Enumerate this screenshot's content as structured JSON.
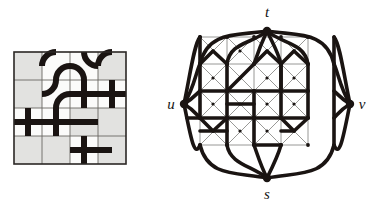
{
  "figure": {
    "caption": "",
    "panels": [
      "grid-tiling-panel",
      "graph-panel"
    ]
  },
  "colors": {
    "ink": "#1a1412",
    "ink_soft": "#241c18",
    "grid_line": "#5b5754",
    "cell_shaded": "#e2e2e0",
    "cell_empty": "#fbfbfa",
    "lattice_thin": "#8d8d8b",
    "border": "#2b2725",
    "background": "#ffffff"
  },
  "left_panel": {
    "name": "grid-tiling-panel",
    "rows": 4,
    "cols": 4,
    "origin": {
      "x": 14,
      "y": 52
    },
    "cell": 28,
    "cells": [
      {
        "r": 0,
        "c": 0,
        "fill": "shaded"
      },
      {
        "r": 0,
        "c": 1,
        "fill": "empty"
      },
      {
        "r": 0,
        "c": 2,
        "fill": "empty"
      },
      {
        "r": 0,
        "c": 3,
        "fill": "shaded"
      },
      {
        "r": 1,
        "c": 0,
        "fill": "shaded"
      },
      {
        "r": 1,
        "c": 1,
        "fill": "empty"
      },
      {
        "r": 1,
        "c": 2,
        "fill": "empty"
      },
      {
        "r": 1,
        "c": 3,
        "fill": "empty"
      },
      {
        "r": 2,
        "c": 0,
        "fill": "empty"
      },
      {
        "r": 2,
        "c": 1,
        "fill": "empty"
      },
      {
        "r": 2,
        "c": 2,
        "fill": "shaded"
      },
      {
        "r": 2,
        "c": 3,
        "fill": "shaded"
      },
      {
        "r": 3,
        "c": 0,
        "fill": "shaded"
      },
      {
        "r": 3,
        "c": 1,
        "fill": "shaded"
      },
      {
        "r": 3,
        "c": 2,
        "fill": "empty"
      },
      {
        "r": 3,
        "c": 3,
        "fill": "shaded"
      }
    ],
    "crosses": [
      {
        "r": 1,
        "c": 3,
        "name": "cross-r1c3"
      },
      {
        "r": 2,
        "c": 0,
        "name": "cross-r2c0"
      },
      {
        "r": 2,
        "c": 1,
        "name": "cross-r2c1"
      },
      {
        "r": 3,
        "c": 2,
        "name": "cross-r3c2"
      }
    ],
    "stroke_width": 6
  },
  "right_panel": {
    "name": "graph-panel",
    "center": {
      "x": 107,
      "y": 104
    },
    "lattice": {
      "rows": 4,
      "cols": 4,
      "cell": 27,
      "origin": {
        "x": 40,
        "y": 37
      },
      "diagonal_style": "thin-gray",
      "gadget": "square-with-X"
    },
    "terminals": [
      {
        "id": "t",
        "label": "t",
        "x": 107,
        "y": 31,
        "label_x": 107,
        "label_y": 17,
        "name": "vertex-t"
      },
      {
        "id": "u",
        "label": "u",
        "x": 24,
        "y": 104,
        "label_x": 11,
        "label_y": 103,
        "name": "vertex-u"
      },
      {
        "id": "v",
        "label": "v",
        "x": 190,
        "y": 104,
        "label_x": 202,
        "label_y": 103,
        "name": "vertex-v"
      },
      {
        "id": "s",
        "label": "s",
        "x": 107,
        "y": 178,
        "label_x": 107,
        "label_y": 199,
        "name": "vertex-s"
      }
    ],
    "fan_edges_per_terminal": 4,
    "stroke_width_bold": 3.6,
    "stroke_width_thin": 0.9
  }
}
